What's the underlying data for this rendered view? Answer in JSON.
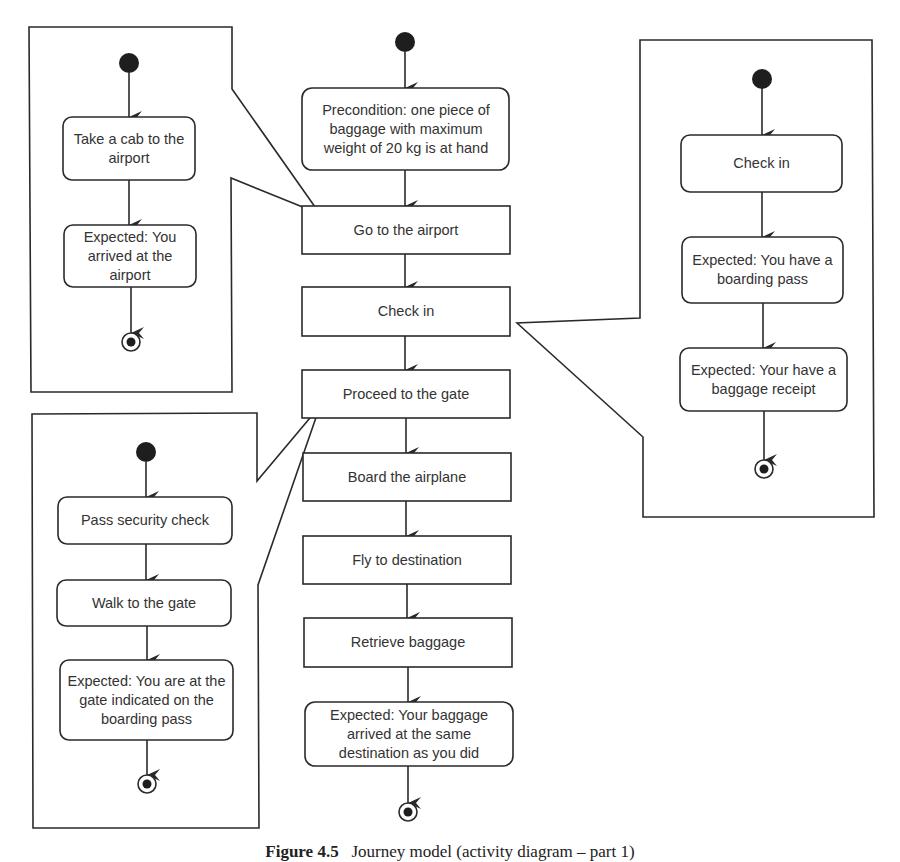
{
  "figure": {
    "caption_label": "Figure 4.5",
    "caption_text": "Journey model (activity diagram – part 1)"
  },
  "main_flow": {
    "nodes": [
      {
        "id": "precondition",
        "shape": "rounded",
        "text": "Precondition: one piece of baggage with maximum weight of 20 kg is at hand"
      },
      {
        "id": "go-to-airport",
        "shape": "rect",
        "text": "Go to the airport"
      },
      {
        "id": "check-in",
        "shape": "rect",
        "text": "Check in"
      },
      {
        "id": "proceed-to-gate",
        "shape": "rect",
        "text": "Proceed to the gate"
      },
      {
        "id": "board-airplane",
        "shape": "rect",
        "text": "Board the airplane"
      },
      {
        "id": "fly-to-destination",
        "shape": "rect",
        "text": "Fly to destination"
      },
      {
        "id": "retrieve-baggage",
        "shape": "rect",
        "text": "Retrieve baggage"
      },
      {
        "id": "expected-baggage",
        "shape": "rounded",
        "text": "Expected: Your baggage arrived at the same destination as you did"
      }
    ]
  },
  "callouts": {
    "go_to_airport": {
      "refines": "Go to the airport",
      "nodes": [
        {
          "text": "Take a cab to the airport"
        },
        {
          "text": "Expected: You arrived at the airport"
        }
      ]
    },
    "check_in": {
      "refines": "Check in",
      "nodes": [
        {
          "text": "Check in"
        },
        {
          "text": "Expected: You have a boarding pass"
        },
        {
          "text": "Expected: Your have a baggage receipt"
        }
      ]
    },
    "proceed_to_gate": {
      "refines": "Proceed to the gate",
      "nodes": [
        {
          "text": "Pass security check"
        },
        {
          "text": "Walk to the gate"
        },
        {
          "text": "Expected: You are at the gate indicated on the boarding pass"
        }
      ]
    }
  },
  "colors": {
    "line": "#2a2a2a",
    "text": "#333333",
    "background": "#ffffff"
  }
}
